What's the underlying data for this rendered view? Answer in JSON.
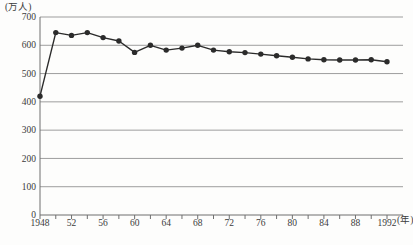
{
  "chart_data": {
    "type": "line",
    "title": "",
    "y_unit_label": "(万人)",
    "x_unit_label": "(年)",
    "ylim": [
      0,
      700
    ],
    "y_ticks": [
      0,
      100,
      200,
      300,
      400,
      500,
      600,
      700
    ],
    "x_minor_tick_step_years": 2,
    "x_range": [
      1948,
      1992
    ],
    "x_tick_labels": [
      {
        "year": 1948,
        "label": "1948"
      },
      {
        "year": 1952,
        "label": "52"
      },
      {
        "year": 1956,
        "label": "56"
      },
      {
        "year": 1960,
        "label": "60"
      },
      {
        "year": 1964,
        "label": "64"
      },
      {
        "year": 1968,
        "label": "68"
      },
      {
        "year": 1972,
        "label": "72"
      },
      {
        "year": 1976,
        "label": "76"
      },
      {
        "year": 1980,
        "label": "80"
      },
      {
        "year": 1984,
        "label": "84"
      },
      {
        "year": 1988,
        "label": "88"
      },
      {
        "year": 1992,
        "label": "1992"
      }
    ],
    "grid": true,
    "legend_position": "none",
    "series": [
      {
        "name": "population",
        "x": [
          1948,
          1950,
          1952,
          1954,
          1956,
          1958,
          1960,
          1962,
          1964,
          1966,
          1968,
          1970,
          1972,
          1974,
          1976,
          1978,
          1980,
          1982,
          1984,
          1986,
          1988,
          1990,
          1992
        ],
        "values": [
          420,
          645,
          635,
          645,
          627,
          615,
          575,
          600,
          583,
          590,
          600,
          583,
          577,
          574,
          569,
          563,
          558,
          552,
          549,
          548,
          548,
          549,
          542
        ]
      }
    ],
    "colors": {
      "line": "#2b2b2b",
      "marker": "#2b2b2b",
      "grid": "#9d9d9d",
      "axis": "#6f6f6f",
      "text": "#3b3b3b",
      "background": "#fdfdfc"
    }
  }
}
